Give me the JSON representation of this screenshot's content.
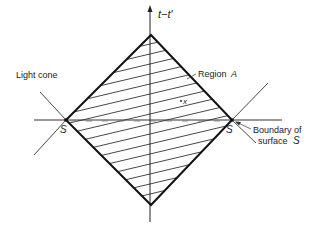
{
  "diagram": {
    "type": "spacetime-light-cone",
    "axis_label": "t−t′",
    "labels": {
      "region": "Region",
      "region_symbol": "A",
      "point": "x",
      "light_cone": "Light cone",
      "left_point": "S",
      "right_point": "S",
      "boundary_line1": "Boundary of",
      "boundary_line2": "surface",
      "boundary_symbol": "S"
    },
    "colors": {
      "line": "#222222",
      "hatch": "#333333",
      "background": "#ffffff"
    }
  }
}
